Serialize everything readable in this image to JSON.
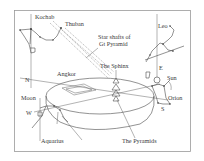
{
  "frame": {
    "border_color": "#9a9a9a",
    "background": "#ffffff"
  },
  "labels": {
    "kochab": "Kochab",
    "thuban": "Thuban",
    "star_shafts_line1": "Star shafts of",
    "star_shafts_line2": "Gt Pyramid",
    "leo": "Leo",
    "sphinx": "The Sphinx",
    "angkor": "Angkor",
    "north": "N",
    "east": "E",
    "sun": "Sun",
    "moon": "Moon",
    "west": "W",
    "orion": "Orion",
    "south": "S",
    "aquarius": "Aquarius",
    "pyramids": "The Pyramids"
  }
}
